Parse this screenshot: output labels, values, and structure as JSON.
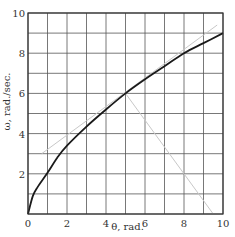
{
  "chart_data": {
    "type": "line",
    "title": "",
    "xlabel": "θ, rad.",
    "ylabel": "ω, rad./sec.",
    "xlim": [
      0,
      10
    ],
    "ylim": [
      0,
      10
    ],
    "grid": true,
    "grid_step": 1,
    "x_ticks": [
      0,
      2,
      4,
      6,
      8,
      10
    ],
    "y_ticks": [
      2,
      4,
      6,
      8,
      10
    ],
    "x_tick_labels": [
      "0",
      "2",
      "4",
      "6",
      "8",
      "10"
    ],
    "y_tick_labels": [
      "2",
      "4",
      "6",
      "8",
      "10"
    ],
    "legend": null,
    "series": [
      {
        "name": "omega-vs-theta curve",
        "style": "solid-dark",
        "x": [
          0,
          0.25,
          0.5,
          1,
          1.5,
          2,
          3,
          4,
          5,
          6,
          7,
          8,
          9,
          10
        ],
        "y": [
          0,
          0.9,
          1.35,
          2.05,
          2.8,
          3.4,
          4.35,
          5.2,
          6.0,
          6.7,
          7.35,
          8.0,
          8.5,
          9.0
        ]
      },
      {
        "name": "tangent line at theta=5",
        "style": "solid-light",
        "x": [
          0.7,
          9.7
        ],
        "y": [
          3.0,
          9.4
        ]
      },
      {
        "name": "normal line at theta=5",
        "style": "solid-light",
        "x": [
          5,
          9.5
        ],
        "y": [
          6.0,
          0
        ]
      }
    ]
  },
  "colors": {
    "grid": "#555555",
    "curve": "#1a1a1a",
    "construction_line": "#c8c8c8",
    "background": "#ffffff"
  }
}
